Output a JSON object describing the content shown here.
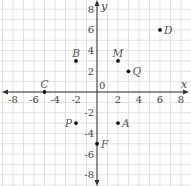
{
  "plane": {
    "x_axis_label": "x",
    "y_axis_label": "y",
    "origin_label": "0",
    "x_range": [
      -9,
      9
    ],
    "y_range": [
      -9,
      9
    ],
    "x_ticks": [
      {
        "value": -8,
        "label": "-8"
      },
      {
        "value": -6,
        "label": "-6"
      },
      {
        "value": -4,
        "label": "-4"
      },
      {
        "value": -2,
        "label": "-2"
      },
      {
        "value": 2,
        "label": "2"
      },
      {
        "value": 4,
        "label": "4"
      },
      {
        "value": 6,
        "label": "6"
      },
      {
        "value": 8,
        "label": "8"
      }
    ],
    "y_ticks": [
      {
        "value": 8,
        "label": "8"
      },
      {
        "value": 6,
        "label": "6"
      },
      {
        "value": 4,
        "label": "4"
      },
      {
        "value": 2,
        "label": "2"
      },
      {
        "value": -2,
        "label": "-2"
      },
      {
        "value": -4,
        "label": "-4"
      },
      {
        "value": -6,
        "label": "-6"
      },
      {
        "value": -8,
        "label": "-8"
      }
    ],
    "colors": {
      "grid": "#d6d6d6",
      "axis": "#333333",
      "point": "#111111",
      "label": "#555555"
    }
  },
  "points": [
    {
      "name": "B",
      "x": -2,
      "y": 3,
      "label_pos": "above"
    },
    {
      "name": "M",
      "x": 2,
      "y": 3,
      "label_pos": "above"
    },
    {
      "name": "Q",
      "x": 3,
      "y": 2,
      "label_pos": "right"
    },
    {
      "name": "D",
      "x": 6,
      "y": 6,
      "label_pos": "right"
    },
    {
      "name": "C",
      "x": -5,
      "y": 0,
      "label_pos": "above"
    },
    {
      "name": "P",
      "x": -2,
      "y": -3,
      "label_pos": "left"
    },
    {
      "name": "A",
      "x": 2,
      "y": -3,
      "label_pos": "right"
    },
    {
      "name": "F",
      "x": 0,
      "y": -5,
      "label_pos": "right"
    }
  ]
}
